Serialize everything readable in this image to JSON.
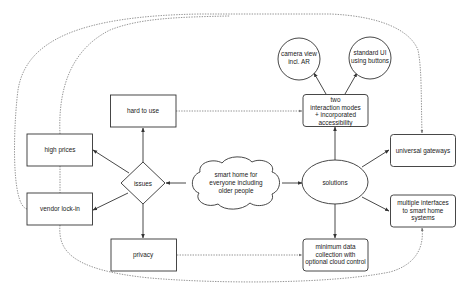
{
  "diagram": {
    "center": {
      "label_lines": [
        "smart home for",
        "everyone including",
        "older people"
      ]
    },
    "issues": {
      "label": "issues",
      "children": [
        {
          "id": "hard_to_use",
          "label_lines": [
            "hard to use"
          ]
        },
        {
          "id": "high_prices",
          "label_lines": [
            "high prices"
          ]
        },
        {
          "id": "vendor_lock_in",
          "label_lines": [
            "vendor lock-in"
          ]
        },
        {
          "id": "privacy",
          "label_lines": [
            "privacy"
          ]
        }
      ]
    },
    "solutions": {
      "label": "solutions",
      "children": [
        {
          "id": "two_interaction_modes",
          "label_lines": [
            "two",
            "interaction modes",
            "+ incorporated",
            "accessibility"
          ]
        },
        {
          "id": "universal_gateways",
          "label_lines": [
            "universal gateways"
          ]
        },
        {
          "id": "multiple_interfaces",
          "label_lines": [
            "multiple interfaces",
            "to smart home",
            "systems"
          ]
        },
        {
          "id": "minimum_data",
          "label_lines": [
            "minimum data",
            "collection with",
            "optional cloud control"
          ]
        }
      ]
    },
    "interaction_modes": [
      {
        "id": "camera_view",
        "label_lines": [
          "camera view",
          "incl. AR"
        ]
      },
      {
        "id": "standard_ui",
        "label_lines": [
          "standard UI",
          "using buttons"
        ]
      }
    ],
    "dashed_links": [
      {
        "from": "hard to use",
        "to": "two interaction modes + incorporated accessibility"
      },
      {
        "from": "privacy",
        "to": "minimum data collection with optional cloud control"
      },
      {
        "from": "high prices",
        "to": "universal gateways"
      },
      {
        "from": "vendor lock-in",
        "to": "universal gateways"
      },
      {
        "from": "vendor lock-in",
        "to": "multiple interfaces to smart home systems"
      }
    ],
    "colors": {
      "stroke": "#333333",
      "dashed": "#666666",
      "background": "#ffffff"
    }
  }
}
